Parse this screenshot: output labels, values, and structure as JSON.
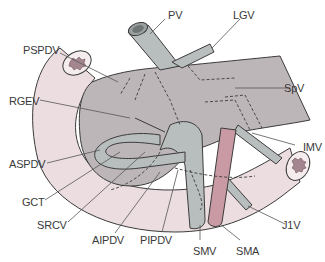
{
  "diagram": {
    "type": "anatomical-illustration",
    "colors": {
      "pancreas": "#bdb6b8",
      "vein": "#b8bebd",
      "duodenum": "#ecdde0",
      "artery": "#c99aa3",
      "outline": "#3b3b3b",
      "leader_line": "#555555",
      "label_text": "#3a3a3a"
    },
    "labels": {
      "pv": "PV",
      "lgv": "LGV",
      "pspdv": "PSPDV",
      "spv": "SpV",
      "rgev": "RGEV",
      "imv": "IMV",
      "aspdv": "ASPDV",
      "gct": "GCT",
      "j1v": "J1V",
      "srcv": "SRCV",
      "aipdv": "AIPDV",
      "pipdv": "PIPDV",
      "smv": "SMV",
      "sma": "SMA"
    }
  }
}
